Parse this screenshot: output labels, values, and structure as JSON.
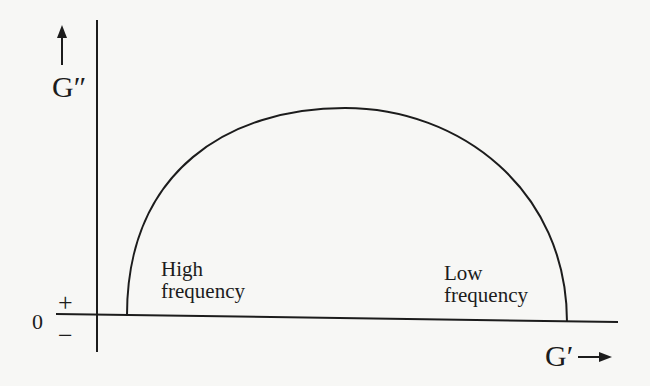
{
  "diagram": {
    "type": "Cole-Cole style plot (loss modulus vs storage modulus)",
    "y_axis": {
      "label": "G″",
      "direction": "up",
      "zero_label": "0",
      "positive_sign": "+",
      "negative_sign": "−"
    },
    "x_axis": {
      "label": "G′",
      "direction": "right"
    },
    "curve": {
      "shape": "semicircle",
      "color": "#1c1c1c"
    },
    "regions": [
      {
        "id": "high",
        "line1": "High",
        "line2": "frequency"
      },
      {
        "id": "low",
        "line1": "Low",
        "line2": "frequency"
      }
    ],
    "colors": {
      "background": "#f7f7f5",
      "ink": "#1c1c1c"
    }
  }
}
